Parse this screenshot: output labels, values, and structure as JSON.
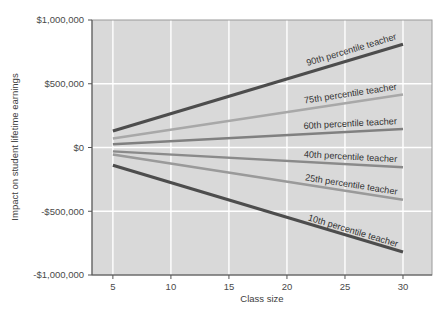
{
  "chart_data": {
    "type": "line",
    "title": "",
    "subtitle": "",
    "xlabel": "Class size",
    "ylabel": "Impact on student lifetime earnings",
    "xlim": [
      3.2,
      32.5
    ],
    "ylim": [
      -1000000,
      1000000
    ],
    "xticks": [
      5,
      10,
      15,
      20,
      25,
      30
    ],
    "xticklabels": [
      "5",
      "10",
      "15",
      "20",
      "25",
      "30"
    ],
    "yticks": [
      1000000,
      500000,
      0,
      -500000,
      -1000000
    ],
    "yticklabels": [
      "$1,000,000",
      "$500,000",
      "$0",
      "-$500,000",
      "-$1,000,000"
    ],
    "grid": true,
    "grid_color": "#ffffff",
    "plot_background": "#d9d9d9",
    "legend": "inline-labels",
    "legend_position": "along-lines",
    "x": [
      5,
      30
    ],
    "series": [
      {
        "name": "90th percentile teacher",
        "label": "90th percentile teacher",
        "values": [
          130000,
          810000
        ],
        "color": "#4d4d4d",
        "width": 3.1
      },
      {
        "name": "75th percentile teacher",
        "label": "75th percentile teacher",
        "values": [
          70000,
          415000
        ],
        "color": "#a8a8a8",
        "width": 2.6
      },
      {
        "name": "60th percentile teacher",
        "label": "60th percentile teacher",
        "values": [
          25000,
          145000
        ],
        "color": "#808080",
        "width": 2.4
      },
      {
        "name": "40th percentile teacher",
        "label": "40th percentile teacher",
        "values": [
          -30000,
          -155000
        ],
        "color": "#8a8a8a",
        "width": 2.4
      },
      {
        "name": "25th percentile teacher",
        "label": "25th percentile teacher",
        "values": [
          -55000,
          -410000
        ],
        "color": "#9a9a9a",
        "width": 2.6
      },
      {
        "name": "10th percentile teacher",
        "label": "10th percentile teacher",
        "values": [
          -140000,
          -820000
        ],
        "color": "#4d4d4d",
        "width": 3.1
      }
    ]
  }
}
